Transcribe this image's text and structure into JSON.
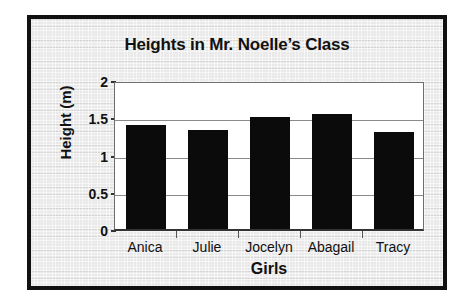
{
  "chart_data": {
    "type": "bar",
    "title": "Heights in Mr. Noelle’s Class",
    "xlabel": "Girls",
    "ylabel": "Height (m)",
    "categories": [
      "Anica",
      "Julie",
      "Jocelyn",
      "Abagail",
      "Tracy"
    ],
    "values": [
      1.4,
      1.33,
      1.5,
      1.55,
      1.3
    ],
    "ylim": [
      0,
      2
    ],
    "yticks": [
      0,
      0.5,
      1,
      1.5,
      2
    ],
    "ytick_labels": [
      "0",
      "0.5",
      "1",
      "1.5",
      "2"
    ],
    "grid": true,
    "legend": "none",
    "bar_color": "#0b0b0b",
    "plot_background": "#ffffff",
    "frame_color": "#111111",
    "poster_background": "#e9e9e9"
  }
}
